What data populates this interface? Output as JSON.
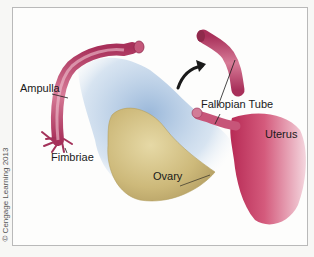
{
  "figure": {
    "labels": {
      "ampulla": "Ampulla",
      "fimbriae": "Fimbriae",
      "ovary": "Ovary",
      "fallopian_tube": "Fallopian Tube",
      "uterus": "Uterus"
    },
    "copyright": "© Cengage Learning 2013",
    "colors": {
      "tube": "#b8466e",
      "uterus": "#c63a62",
      "ovary": "#cdb97a",
      "ligament": "#a9c4e0",
      "arrow": "#1a1a1a",
      "frame": "#b9b9b9"
    }
  }
}
